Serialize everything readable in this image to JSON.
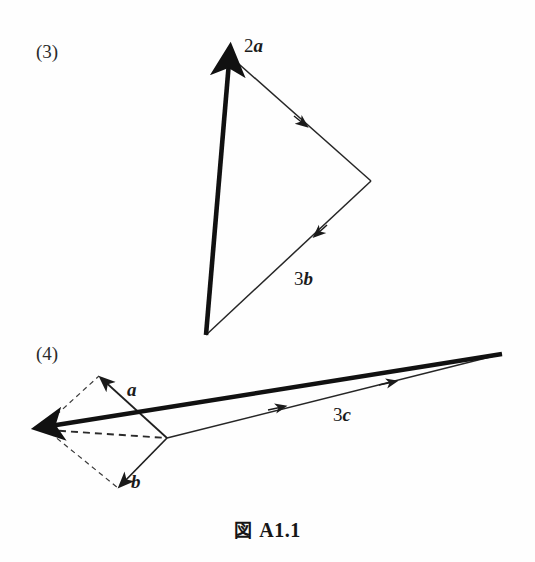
{
  "figure": {
    "caption_symbol": "図",
    "caption_number": "A1.1",
    "background_color": "#fefefe",
    "ink_color": "#1a1a1a",
    "width": 535,
    "height": 562
  },
  "parts": [
    {
      "number": "(3)",
      "number_x": 36,
      "number_y": 42,
      "labels": [
        {
          "name": "2a",
          "coefficient": "2",
          "symbol": "a",
          "x": 244,
          "y": 36
        },
        {
          "name": "3b",
          "coefficient": "3",
          "symbol": "b",
          "x": 294,
          "y": 269
        }
      ],
      "geometry": {
        "resultant_vector": {
          "from": [
            206,
            335
          ],
          "to": [
            229,
            58
          ],
          "style": "thick-solid-arrow"
        },
        "edges": [
          {
            "name": "2a-edge",
            "from": [
              231,
              57
            ],
            "to": [
              371,
              181
            ],
            "style": "thin-solid",
            "mid_arrow": [
              303,
              123
            ]
          },
          {
            "name": "3b-edge",
            "from": [
              371,
              181
            ],
            "to": [
              206,
              335
            ],
            "style": "thin-solid",
            "mid_arrow": [
              317,
              234
            ]
          }
        ]
      }
    },
    {
      "number": "(4)",
      "number_x": 36,
      "number_y": 344,
      "labels": [
        {
          "name": "a",
          "coefficient": "",
          "symbol": "a",
          "x": 127,
          "y": 380
        },
        {
          "name": "b",
          "coefficient": "",
          "symbol": "b",
          "x": 131,
          "y": 472
        },
        {
          "name": "3c",
          "coefficient": "3",
          "symbol": "c",
          "x": 333,
          "y": 405
        }
      ],
      "geometry": {
        "resultant_vector": {
          "from": [
            502,
            354
          ],
          "to": [
            44,
            427
          ],
          "style": "thick-solid-arrow"
        },
        "edges": [
          {
            "name": "a-vector",
            "from": [
              167,
              438
            ],
            "to": [
              99,
              376
            ],
            "style": "thin-solid-arrow"
          },
          {
            "name": "b-vector",
            "from": [
              167,
              438
            ],
            "to": [
              118,
              488
            ],
            "style": "thin-solid-arrow"
          },
          {
            "name": "3c-edge",
            "from": [
              167,
              438
            ],
            "to": [
              502,
              354
            ],
            "style": "thin-solid",
            "mid_arrows": [
              [
                281,
                407
              ],
              [
                392,
                382
              ]
            ]
          }
        ],
        "dashed_edges": [
          {
            "name": "dashed-top-left",
            "from": [
              42,
              427
            ],
            "to": [
              99,
              376
            ]
          },
          {
            "name": "dashed-diagonal",
            "from": [
              42,
              427
            ],
            "to": [
              167,
              438
            ]
          },
          {
            "name": "dashed-bottom-left",
            "from": [
              42,
              427
            ],
            "to": [
              118,
              488
            ]
          }
        ]
      }
    }
  ]
}
